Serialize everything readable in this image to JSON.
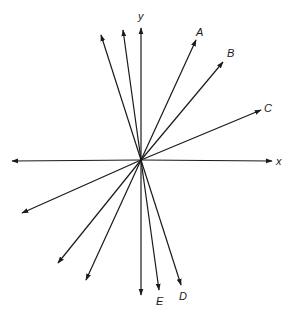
{
  "diagram": {
    "type": "vector-diagram",
    "origin": [
      141,
      160
    ],
    "axes": {
      "x_label": "x",
      "y_label": "y"
    },
    "labels": {
      "A": "A",
      "B": "B",
      "C": "C",
      "D": "D",
      "E": "E"
    },
    "vectors": [
      {
        "name": "x-axis-positive",
        "tip": [
          272,
          161
        ]
      },
      {
        "name": "x-axis-negative",
        "tip": [
          12,
          161
        ]
      },
      {
        "name": "y-axis-positive",
        "tip": [
          141,
          28
        ]
      },
      {
        "name": "y-axis-negative",
        "tip": [
          141,
          295
        ]
      },
      {
        "name": "A",
        "tip": [
          196,
          40
        ]
      },
      {
        "name": "B",
        "tip": [
          223,
          62
        ]
      },
      {
        "name": "C",
        "tip": [
          261,
          110
        ]
      },
      {
        "name": "D",
        "tip": [
          181,
          285
        ]
      },
      {
        "name": "E",
        "tip": [
          159,
          290
        ]
      },
      {
        "name": "unlabeled-upper-left-1",
        "tip": [
          101,
          35
        ]
      },
      {
        "name": "unlabeled-upper-left-2",
        "tip": [
          123,
          30
        ]
      },
      {
        "name": "unlabeled-lower-left-1",
        "tip": [
          22,
          213
        ]
      },
      {
        "name": "unlabeled-lower-left-2",
        "tip": [
          58,
          263
        ]
      },
      {
        "name": "unlabeled-lower-left-3",
        "tip": [
          86,
          280
        ]
      }
    ],
    "colors": {
      "stroke": "#1a1a1a",
      "background": "#ffffff"
    }
  }
}
